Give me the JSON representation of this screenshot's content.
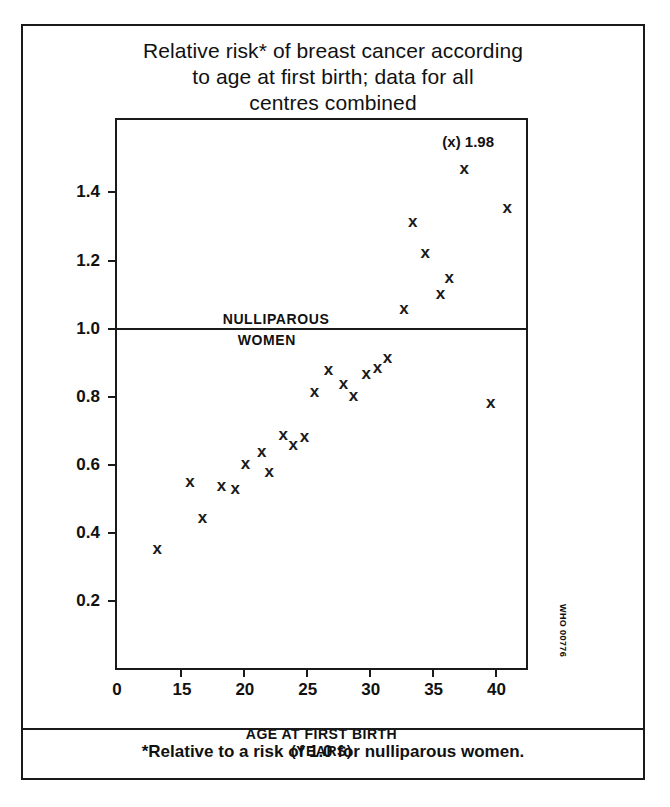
{
  "figure": {
    "title_lines": [
      "Relative risk* of breast cancer according",
      "to age at first birth; data for all",
      "centres combined"
    ],
    "footnote": "*Relative to a risk of 1.0 for nulliparous women.",
    "who_code": "WHO 00776"
  },
  "chart_data": {
    "type": "scatter",
    "title": "Relative risk* of breast cancer according to age at first birth; data for all centres combined",
    "xlabel": "AGE AT FIRST BIRTH (YEARS)",
    "xlabel_lines": [
      "AGE AT FIRST BIRTH",
      "(YEARS)"
    ],
    "ylabel": "",
    "xlim": [
      10.0,
      42.5
    ],
    "ylim": [
      0.0,
      1.61
    ],
    "xticks": [
      15,
      20,
      25,
      30,
      35,
      40
    ],
    "xtick_labels": [
      "15",
      "20",
      "25",
      "30",
      "35",
      "40"
    ],
    "origin_label": "0",
    "yticks": [
      0.2,
      0.4,
      0.6,
      0.8,
      1.0,
      1.2,
      1.4
    ],
    "ytick_labels": [
      "0.2",
      "0.4",
      "0.6",
      "0.8",
      "1.0",
      "1.2",
      "1.4"
    ],
    "grid": false,
    "legend": "none",
    "marker": "x",
    "marker_color": "#1a1a1a",
    "reference_line": {
      "y": 1.0,
      "label_above": "NULLIPAROUS",
      "label_below": "WOMEN"
    },
    "annotations": [
      {
        "text": "(x) 1.98",
        "x": 37.6,
        "y": 1.545
      }
    ],
    "points": [
      {
        "x": 13.2,
        "y": 0.35
      },
      {
        "x": 15.8,
        "y": 0.545
      },
      {
        "x": 16.8,
        "y": 0.44
      },
      {
        "x": 18.3,
        "y": 0.535
      },
      {
        "x": 19.4,
        "y": 0.525
      },
      {
        "x": 20.2,
        "y": 0.6
      },
      {
        "x": 21.5,
        "y": 0.635
      },
      {
        "x": 22.1,
        "y": 0.575
      },
      {
        "x": 23.2,
        "y": 0.685
      },
      {
        "x": 24.0,
        "y": 0.655
      },
      {
        "x": 24.9,
        "y": 0.68
      },
      {
        "x": 25.7,
        "y": 0.81
      },
      {
        "x": 26.8,
        "y": 0.875
      },
      {
        "x": 28.0,
        "y": 0.835
      },
      {
        "x": 28.8,
        "y": 0.8
      },
      {
        "x": 29.8,
        "y": 0.865
      },
      {
        "x": 30.7,
        "y": 0.88
      },
      {
        "x": 31.5,
        "y": 0.91
      },
      {
        "x": 32.8,
        "y": 1.055
      },
      {
        "x": 33.5,
        "y": 1.31
      },
      {
        "x": 34.5,
        "y": 1.22
      },
      {
        "x": 35.7,
        "y": 1.1
      },
      {
        "x": 36.4,
        "y": 1.145
      },
      {
        "x": 37.6,
        "y": 1.465
      },
      {
        "x": 39.7,
        "y": 0.78
      },
      {
        "x": 41.0,
        "y": 1.35
      }
    ]
  }
}
